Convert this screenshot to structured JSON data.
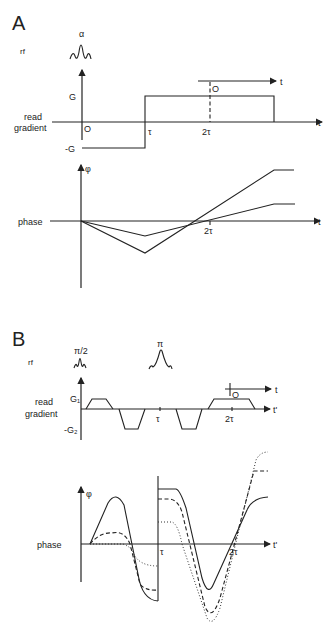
{
  "panel_a": {
    "label": "A",
    "rf_label": "rf",
    "pulse_label": "α",
    "gradient_label_line1": "read",
    "gradient_label_line2": "gradient",
    "g_pos": "G",
    "g_neg": "-G",
    "origin": "O",
    "tau": "τ",
    "two_tau": "2τ",
    "t_axis": "t",
    "echo_origin": "O",
    "echo_t": "t",
    "phase_label": "phase",
    "phi": "φ",
    "phase_two_tau": "2τ",
    "phase_t": "t"
  },
  "panel_b": {
    "label": "B",
    "rf_label": "rf",
    "pulse1_label": "π/2",
    "pulse2_label": "π",
    "gradient_label_line1": "read",
    "gradient_label_line2": "gradient",
    "g1": "G₁",
    "g2": "-G₂",
    "tau": "τ",
    "two_tau": "2τ",
    "t_prime": "t'",
    "echo_origin": "O",
    "echo_t": "t",
    "phase_label": "phase",
    "phi": "φ",
    "phase_tau": "τ",
    "phase_two_tau": "2τ",
    "phase_t_prime": "t'",
    "line_styles": [
      "solid",
      "dashed",
      "dotted"
    ]
  }
}
